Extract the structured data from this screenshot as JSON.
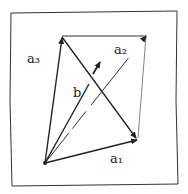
{
  "diagram": {
    "type": "vector-sketch",
    "labels": {
      "a1": "a₁",
      "a2": "a₂",
      "a3": "a₃",
      "b": "b"
    },
    "colors": {
      "ink": "#222222",
      "paper": "#ffffff"
    }
  }
}
